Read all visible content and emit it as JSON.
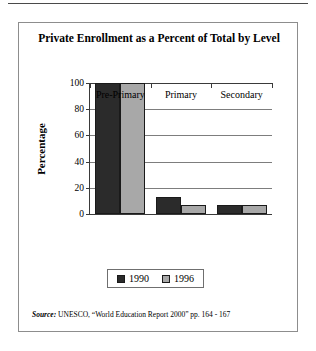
{
  "figure": {
    "title": "Private Enrollment as a Percent of Total by Level",
    "source_label": "Source:",
    "source_text": "UNESCO, “World Education Report 2000” pp. 164 - 167"
  },
  "chart_data": {
    "type": "bar",
    "title": "Private Enrollment as a Percent of Total by Level",
    "xlabel": "",
    "ylabel": "Percentage",
    "ylim": [
      0,
      100
    ],
    "yticks": [
      0,
      20,
      40,
      60,
      80,
      100
    ],
    "grid": true,
    "legend_position": "bottom",
    "categories": [
      "Pre-Primary",
      "Primary",
      "Secondary"
    ],
    "series": [
      {
        "name": "1990",
        "color": "#2b2b2b",
        "values": [
          100,
          13,
          7
        ]
      },
      {
        "name": "1996",
        "color": "#a8a8a8",
        "values": [
          100,
          7,
          7
        ]
      }
    ]
  }
}
